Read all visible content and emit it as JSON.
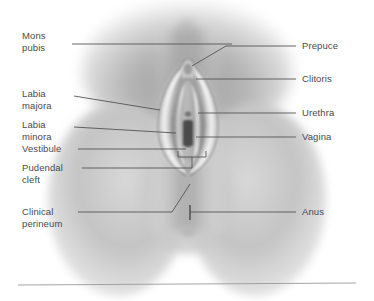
{
  "figure": {
    "view": "Anterior / lithotomy view",
    "style": "grayscale airbrush medical illustration",
    "width": 374,
    "height": 301,
    "background_color": "#ffffff",
    "leader_line_color": "#555555",
    "label_text_color": "#4a4a4a",
    "skin_tone_light": "#f2f2f2",
    "skin_tone_mid": "#c8c8c8",
    "skin_tone_dark": "#8e8e8e",
    "orifice_color": "#4a4a4a"
  },
  "labels_left": [
    {
      "id": "mons-pubis",
      "text": "Mons\npubis",
      "x": 22,
      "y": 30,
      "leader": {
        "x1": 72,
        "y1": 44,
        "x2": 232,
        "y2": 44
      }
    },
    {
      "id": "labia-majora",
      "text": "Labia\najora",
      "display_text": "Labia\nmajora",
      "x": 22,
      "y": 88,
      "leader": {
        "x1": 74,
        "y1": 96,
        "x2": 160,
        "y2": 110
      }
    },
    {
      "id": "labia-minora",
      "text": "Labia\nminora",
      "x": 22,
      "y": 119,
      "leader": {
        "x1": 74,
        "y1": 127,
        "x2": 176,
        "y2": 133
      }
    },
    {
      "id": "vestibule",
      "text": "Vestibule",
      "x": 22,
      "y": 146,
      "leader": {
        "x1": 78,
        "y1": 149,
        "x2": 186,
        "y2": 149
      }
    },
    {
      "id": "pudendal-cleft",
      "text": "Pudendal\ncleft",
      "x": 22,
      "y": 166,
      "leader": {
        "x1": 82,
        "y1": 168,
        "x2": 192,
        "y2": 168
      }
    },
    {
      "id": "clinical-perineum",
      "text": "Clinical\nperineum",
      "x": 22,
      "y": 207,
      "leader": {
        "x1": 78,
        "y1": 212,
        "x2": 172,
        "y2": 212
      }
    }
  ],
  "labels_right": [
    {
      "id": "prepuce",
      "text": "Prepuce",
      "x": 302,
      "y": 42,
      "leader": {
        "x1": 296,
        "y1": 46,
        "x2": 226,
        "y2": 46
      }
    },
    {
      "id": "clitoris",
      "text": "Clitoris",
      "x": 302,
      "y": 75,
      "leader": {
        "x1": 296,
        "y1": 79,
        "x2": 196,
        "y2": 79
      }
    },
    {
      "id": "urethra",
      "text": "Urethra",
      "x": 302,
      "y": 109,
      "leader": {
        "x1": 296,
        "y1": 113,
        "x2": 198,
        "y2": 113
      }
    },
    {
      "id": "vagina",
      "text": "Vagina",
      "x": 302,
      "y": 133,
      "leader": {
        "x1": 296,
        "y1": 137,
        "x2": 196,
        "y2": 137
      }
    },
    {
      "id": "anus",
      "text": "Anus",
      "x": 302,
      "y": 208,
      "leader": {
        "x1": 296,
        "y1": 212,
        "x2": 190,
        "y2": 212
      }
    }
  ],
  "annotations": {
    "prepuce_elbow": {
      "x": 226,
      "y": 46,
      "tip_x": 192,
      "tip_y": 66
    },
    "perineum_elbow": {
      "x": 172,
      "y": 212,
      "tip_x": 190,
      "tip_y": 184
    },
    "anus_tick": {
      "x": 190,
      "y1": 205,
      "y2": 220
    },
    "pudendal_bracket": {
      "left": 178,
      "right": 206,
      "top": 157,
      "stem_x": 192,
      "stem_bottom": 168
    }
  },
  "baseline_rule": {
    "x1": 18,
    "y1": 285,
    "x2": 356,
    "y2": 283
  }
}
